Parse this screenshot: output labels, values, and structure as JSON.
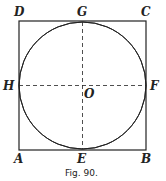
{
  "figure": {
    "caption": "Fig. 90.",
    "labels": {
      "A": "A",
      "B": "B",
      "C": "C",
      "D": "D",
      "E": "E",
      "F": "F",
      "G": "G",
      "H": "H",
      "O": "O"
    }
  },
  "geometry": {
    "square": {
      "x1": 19,
      "y1": 21,
      "x2": 146,
      "y2": 150
    },
    "center": {
      "x": 82.5,
      "y": 85.5
    },
    "radius": 63.5
  },
  "colors": {
    "stroke": "#222222",
    "background": "#ffffff"
  }
}
